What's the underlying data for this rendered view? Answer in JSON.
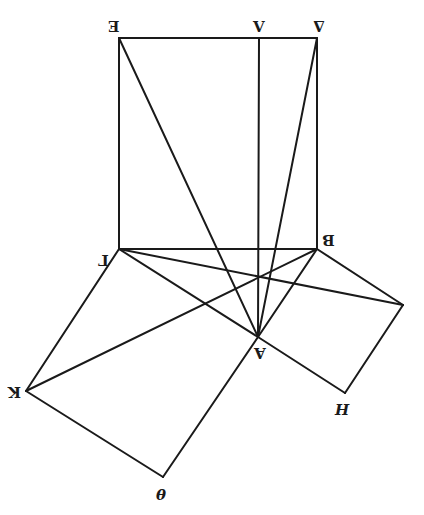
{
  "diagram": {
    "title": "",
    "stroke_color": "#1a1a1a",
    "background": "#ffffff",
    "points": {
      "E": {
        "label": "E",
        "x": 119,
        "y": 38
      },
      "L": {
        "label": "Λ",
        "x": 259,
        "y": 38
      },
      "D": {
        "label": "Δ",
        "x": 317,
        "y": 38
      },
      "G": {
        "label": "Γ",
        "x": 119,
        "y": 249
      },
      "B": {
        "label": "B",
        "x": 317,
        "y": 249
      },
      "A": {
        "label": "A",
        "x": 258,
        "y": 337
      },
      "K": {
        "label": "K",
        "x": 26,
        "y": 391
      },
      "Th": {
        "label": "θ",
        "x": 163,
        "y": 477
      },
      "H": {
        "label": "H",
        "x": 345,
        "y": 393
      },
      "Z": {
        "label": "",
        "x": 403,
        "y": 305
      }
    },
    "segments": [
      [
        "E",
        "D"
      ],
      [
        "E",
        "G"
      ],
      [
        "D",
        "B"
      ],
      [
        "G",
        "B"
      ],
      [
        "L",
        "A"
      ],
      [
        "E",
        "A"
      ],
      [
        "D",
        "A"
      ],
      [
        "G",
        "K"
      ],
      [
        "K",
        "Th"
      ],
      [
        "Th",
        "A"
      ],
      [
        "G",
        "A"
      ],
      [
        "B",
        "Z"
      ],
      [
        "Z",
        "H"
      ],
      [
        "H",
        "A"
      ],
      [
        "B",
        "A"
      ],
      [
        "G",
        "Z"
      ],
      [
        "B",
        "K"
      ]
    ],
    "labels": {
      "E": "E",
      "L": "Λ",
      "D": "Δ",
      "G": "Γ",
      "B": "B",
      "A": "A",
      "K": "K",
      "H": "H",
      "Th": "θ"
    }
  }
}
